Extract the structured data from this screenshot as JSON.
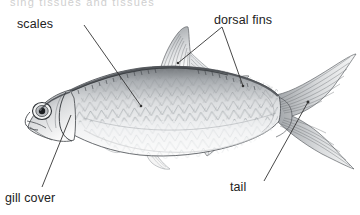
{
  "figure": {
    "type": "labeled-anatomy-diagram",
    "background_color": "#ffffff",
    "line_color": "#333333",
    "text_color": "#222222",
    "width": 360,
    "height": 215,
    "cutoff_header_text": "sing tissues and tissues",
    "labels": [
      {
        "id": "scales",
        "text": "scales",
        "x": 17,
        "y": 17,
        "leader": {
          "from_x": 84,
          "from_y": 25,
          "to_x": 141,
          "to_y": 106
        }
      },
      {
        "id": "dorsal-fins",
        "text": "dorsal fins",
        "x": 214,
        "y": 13,
        "leader_a": {
          "from_x": 222,
          "from_y": 27,
          "to_x": 178,
          "to_y": 63
        },
        "leader_b": {
          "from_x": 222,
          "from_y": 27,
          "to_x": 243,
          "to_y": 86
        }
      },
      {
        "id": "gill-cover",
        "text": "gill cover",
        "x": 5,
        "y": 191,
        "leader": {
          "from_x": 71,
          "from_y": 115,
          "to_x": 42,
          "to_y": 187
        }
      },
      {
        "id": "tail",
        "text": "tail",
        "x": 230,
        "y": 180,
        "leader": {
          "from_x": 308,
          "from_y": 102,
          "to_x": 264,
          "to_y": 181
        }
      }
    ]
  }
}
